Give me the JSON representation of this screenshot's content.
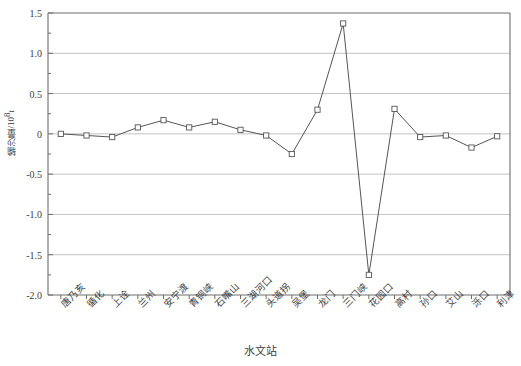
{
  "chart_data": {
    "type": "line",
    "title": "",
    "xlabel": "水文站",
    "ylabel": "输沙量/10",
    "ylabel_sup": "8",
    "ylabel_unit": "t",
    "ylim": [
      -2.0,
      1.5
    ],
    "yticks": [
      "1.5",
      "1.0",
      "0.5",
      "0",
      "-0.5",
      "-1.0",
      "-1.5",
      "-2.0"
    ],
    "ytick_values": [
      1.5,
      1.0,
      0.5,
      0,
      -0.5,
      -1.0,
      -1.5,
      -2.0
    ],
    "minor_tick_step": 0.25,
    "grid": "horizontal",
    "legend": "none",
    "marker": "open-square",
    "line_color": "#555555",
    "grid_color": "#b4b4b4",
    "axis_color": "#6e6e6e",
    "categories": [
      "唐乃亥",
      "循化",
      "上诠",
      "兰州",
      "安宁渡",
      "青铜峡",
      "石嘴山",
      "三湖河口",
      "头道拐",
      "吴堡",
      "龙门",
      "三门峡",
      "花园口",
      "高村",
      "孙口",
      "艾山",
      "泺口",
      "利津"
    ],
    "values": [
      0.0,
      -0.02,
      -0.04,
      0.08,
      0.17,
      0.08,
      0.15,
      0.05,
      -0.02,
      -0.25,
      0.3,
      1.37,
      -1.75,
      0.31,
      -0.04,
      -0.02,
      -0.17,
      -0.03
    ]
  },
  "axes": {
    "left_px": 48,
    "right_px": 510,
    "top_px": 13,
    "bottom_px": 295
  }
}
